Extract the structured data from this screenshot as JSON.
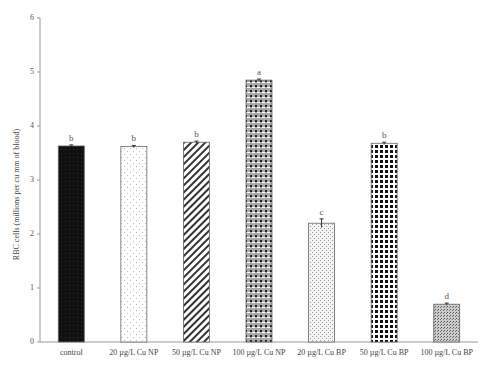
{
  "chart_data": {
    "type": "bar",
    "title": "",
    "xlabel": "",
    "ylabel": "RBC cells (millions per cu mm of blood)",
    "ylim": [
      0,
      6
    ],
    "yticks": [
      0,
      1,
      2,
      3,
      4,
      5,
      6
    ],
    "grid": false,
    "legend": null,
    "categories": [
      "control",
      "20 µg/L Cu NP",
      "50 µg/L Cu NP",
      "100 µg/L Cu NP",
      "20 µg/L Cu BP",
      "50 µg/L Cu BP",
      "100 µg/L Cu BP"
    ],
    "values": [
      3.63,
      3.62,
      3.7,
      4.85,
      2.2,
      3.68,
      0.7
    ],
    "error": [
      0.02,
      0.02,
      0.02,
      0.02,
      0.08,
      0.02,
      0.02
    ],
    "significance_letters": [
      "b",
      "b",
      "b",
      "a",
      "c",
      "b",
      "d"
    ],
    "patterns": [
      "solid-black",
      "light-dotted",
      "diagonal-hatch",
      "checker-gray",
      "fine-dots",
      "diamond-checker",
      "dense-dots"
    ]
  }
}
